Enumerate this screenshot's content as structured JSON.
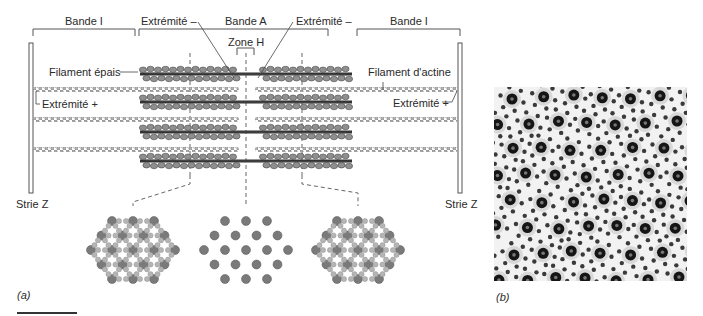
{
  "figure": {
    "panel_a": {
      "label": "(a)",
      "bands": {
        "left_i": "Bande I",
        "a": "Bande A",
        "right_i": "Bande I",
        "zone_h": "Zone H"
      },
      "annotations": {
        "minus_end_left": "Extrémité –",
        "minus_end_right": "Extrémité –",
        "thick_filament": "Filament épais",
        "actin_filament": "Filament d'actine",
        "plus_end_left": "Extrémité +",
        "plus_end_right": "Extrémité +",
        "z_line_left": "Strie Z",
        "z_line_right": "Strie Z"
      },
      "cross_sections": [
        {
          "name": "overlap-region-left",
          "thick": "large dark dots",
          "thin": "small light dots"
        },
        {
          "name": "h-zone",
          "thick": "large dark dots only"
        },
        {
          "name": "overlap-region-right",
          "thick": "large dark dots",
          "thin": "small light dots"
        }
      ],
      "colors": {
        "thick_filament": "#8a8a8a",
        "thin_filament": "#a8a8a8",
        "outline": "#555555",
        "line": "#444444"
      }
    },
    "panel_b": {
      "label": "(b)",
      "description": "electron micrograph cross-section of myofibril lattice"
    }
  }
}
